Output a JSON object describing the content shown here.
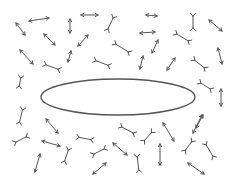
{
  "diagram": {
    "width": 235,
    "height": 183,
    "background": "#ffffff",
    "stroke_color": "#555555",
    "ellipse": {
      "cx": 118,
      "cy": 97,
      "rx": 77,
      "ry": 18,
      "stroke_width": 1.4
    },
    "double_arrows": [
      [
        29,
        21,
        49,
        18
      ],
      [
        16,
        23,
        25,
        35
      ],
      [
        70,
        19,
        70,
        33
      ],
      [
        44,
        34,
        55,
        45
      ],
      [
        20,
        50,
        33,
        64
      ],
      [
        71,
        51,
        68,
        62
      ],
      [
        81,
        15,
        98,
        15
      ],
      [
        88,
        35,
        78,
        46
      ],
      [
        143,
        56,
        140,
        69
      ],
      [
        146,
        15,
        157,
        16
      ],
      [
        209,
        20,
        222,
        31
      ],
      [
        140,
        33,
        155,
        32
      ],
      [
        158,
        40,
        152,
        53
      ],
      [
        175,
        58,
        167,
        70
      ],
      [
        218,
        48,
        222,
        64
      ],
      [
        221,
        89,
        221,
        106
      ],
      [
        203,
        115,
        196,
        128
      ],
      [
        46,
        119,
        58,
        133
      ],
      [
        42,
        141,
        60,
        146
      ],
      [
        40,
        154,
        35,
        172
      ],
      [
        113,
        143,
        127,
        155
      ],
      [
        106,
        163,
        93,
        174
      ],
      [
        163,
        123,
        174,
        141
      ],
      [
        160,
        144,
        160,
        165
      ],
      [
        202,
        115,
        193,
        133
      ],
      [
        188,
        163,
        204,
        174
      ]
    ],
    "double_y_bones": [
      [
        44,
        64,
        60,
        70
      ],
      [
        21,
        76,
        19,
        88
      ],
      [
        114,
        16,
        107,
        31
      ],
      [
        114,
        43,
        130,
        53
      ],
      [
        94,
        60,
        110,
        66
      ],
      [
        193,
        14,
        193,
        30
      ],
      [
        175,
        33,
        190,
        42
      ],
      [
        193,
        59,
        206,
        69
      ],
      [
        199,
        82,
        212,
        90
      ],
      [
        23,
        108,
        19,
        124
      ],
      [
        14,
        143,
        28,
        136
      ],
      [
        69,
        148,
        64,
        163
      ],
      [
        77,
        137,
        93,
        140
      ],
      [
        120,
        126,
        135,
        134
      ],
      [
        92,
        155,
        106,
        148
      ],
      [
        137,
        155,
        139,
        172
      ],
      [
        143,
        142,
        153,
        131
      ],
      [
        184,
        152,
        193,
        140
      ],
      [
        205,
        143,
        214,
        158
      ]
    ]
  }
}
